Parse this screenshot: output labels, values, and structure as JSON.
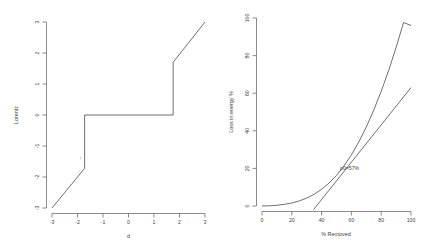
{
  "figure": {
    "panel_count": 2
  },
  "chart_data": [
    {
      "id": "lorentz-step",
      "type": "line",
      "title": "",
      "xlabel": "d",
      "ylabel": "Lorentz",
      "xlim": [
        -3,
        3
      ],
      "ylim": [
        -3,
        3
      ],
      "xticks": [
        "-3",
        "-2",
        "-1",
        "0",
        "1",
        "2",
        "3"
      ],
      "xtick_values": [
        -3,
        -2,
        -1,
        0,
        1,
        2,
        3
      ],
      "yticks": [
        "-3",
        "-2",
        "-1",
        "0",
        "1",
        "2",
        "3"
      ],
      "ytick_values": [
        -3,
        -2,
        -1,
        0,
        1,
        2,
        3
      ],
      "grid": false,
      "legend": "none",
      "series": [
        {
          "name": "Lorentz",
          "x": [
            -3.0,
            -1.72,
            -1.72,
            1.75,
            1.75,
            3.0
          ],
          "y": [
            -3.0,
            -1.72,
            0.0,
            0.0,
            1.7,
            3.0
          ]
        }
      ],
      "notes": "Step / jump discontinuities at d = -1.72 and d = 1.75"
    },
    {
      "id": "energy-loss",
      "type": "line",
      "title": "",
      "xlabel": "% Removed",
      "ylabel": "Loss in energy %",
      "xlim": [
        0,
        100
      ],
      "ylim": [
        0,
        100
      ],
      "xticks": [
        "0",
        "20",
        "40",
        "60",
        "80",
        "100"
      ],
      "xtick_values": [
        0,
        20,
        40,
        60,
        80,
        100
      ],
      "yticks": [
        "0",
        "20",
        "40",
        "60",
        "80",
        "100"
      ],
      "ytick_values": [
        0,
        20,
        40,
        60,
        80,
        100
      ],
      "grid": false,
      "legend": "none",
      "annotations": [
        {
          "text": "p0=57%",
          "x": 60,
          "y": 21
        }
      ],
      "series": [
        {
          "name": "loss-curve",
          "x": [
            0,
            5,
            10,
            15,
            20,
            25,
            30,
            35,
            40,
            45,
            50,
            55,
            60,
            65,
            70,
            75,
            80,
            85,
            90,
            95,
            100
          ],
          "y": [
            0.0,
            0.1,
            0.4,
            0.9,
            1.6,
            2.7,
            4.2,
            6.2,
            8.9,
            12.2,
            16.3,
            21.3,
            27.2,
            34.1,
            42.0,
            51.0,
            61.0,
            72.1,
            84.3,
            97.6,
            96.0
          ]
        },
        {
          "name": "tangent-line",
          "x": [
            34.5,
            100
          ],
          "y": [
            -2.0,
            63.0
          ]
        }
      ]
    }
  ]
}
